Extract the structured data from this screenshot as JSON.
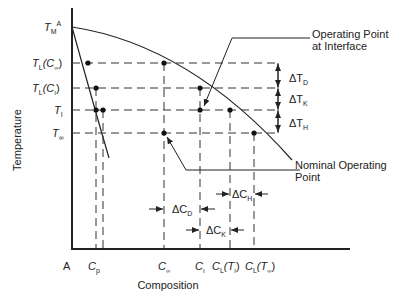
{
  "diagram": {
    "type": "phase-diagram",
    "axes": {
      "x_label": "Composition",
      "y_label": "Temperature",
      "origin_label": "A"
    },
    "y_ticks": [
      {
        "id": "TMA",
        "main": "T",
        "sub": "M",
        "sup": "A",
        "y": 27
      },
      {
        "id": "TLCinf",
        "main": "T",
        "sub": "L",
        "arg": "(C",
        "argsub": "∞",
        "close": ")",
        "y": 63
      },
      {
        "id": "TLCi",
        "main": "T",
        "sub": "L",
        "arg": "(C",
        "argsub": "I",
        "close": ")",
        "y": 88
      },
      {
        "id": "Ti",
        "main": "T",
        "sub": "I",
        "y": 110
      },
      {
        "id": "Tinf",
        "main": "T",
        "sub": "∞",
        "y": 133
      }
    ],
    "x_ticks": [
      {
        "id": "Cp",
        "main": "C",
        "sub": "p",
        "x": 96
      },
      {
        "id": "Cinf",
        "main": "C",
        "sub": "∞",
        "x": 164
      },
      {
        "id": "Ci",
        "main": "C",
        "sub": "I",
        "x": 200
      },
      {
        "id": "CLTi",
        "main": "C",
        "sub": "L",
        "arg": "(T",
        "argsub": "I",
        "close": ")",
        "x": 230
      },
      {
        "id": "CLTinf",
        "main": "C",
        "sub": "L",
        "arg": "(T",
        "argsub": "∞",
        "close": ")",
        "x": 254
      }
    ],
    "delta_T": [
      {
        "label": "ΔT",
        "sub": "D"
      },
      {
        "label": "ΔT",
        "sub": "K"
      },
      {
        "label": "ΔT",
        "sub": "H"
      }
    ],
    "delta_C": [
      {
        "label": "ΔC",
        "sub": "D"
      },
      {
        "label": "ΔC",
        "sub": "K"
      },
      {
        "label": "ΔC",
        "sub": "H"
      }
    ],
    "annotations": {
      "interface": [
        "Operating Point",
        "at Interface"
      ],
      "nominal": [
        "Nominal Operating",
        "Point"
      ]
    },
    "colors": {
      "line": "#222222",
      "dash": "#333333",
      "background": "#ffffff"
    }
  }
}
